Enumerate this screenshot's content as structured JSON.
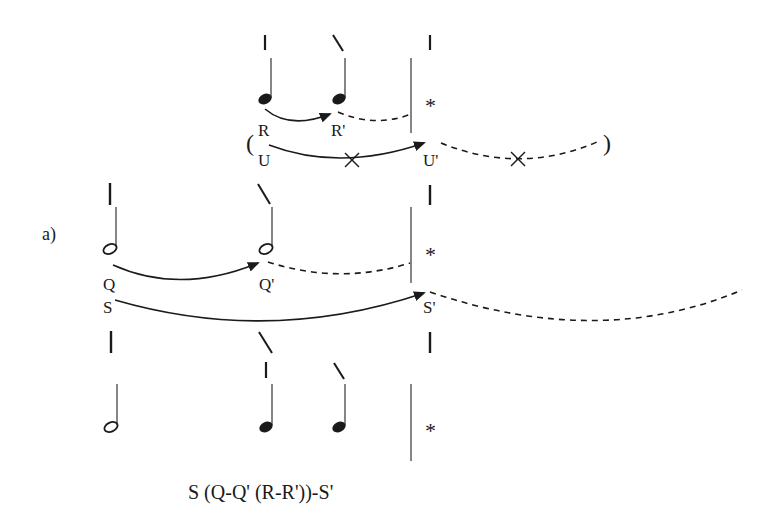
{
  "part_label": "a)",
  "formula": "S (Q-Q' (R-R'))-S'",
  "asterisk": "*",
  "colors": {
    "ink": "#1a1a1a",
    "stem": "#444444"
  },
  "level_top": {
    "labels": {
      "r": "R",
      "r_prime": "R'",
      "u": "U",
      "u_prime": "U'",
      "open_paren": "(",
      "close_paren": ")"
    },
    "notes": [
      "quarter",
      "quarter"
    ],
    "marks": [
      "vertical",
      "slash",
      "vertical"
    ],
    "arcs": [
      {
        "from": "R",
        "to": "R'",
        "style": "solid-arrow"
      },
      {
        "from": "R'",
        "to": "barline",
        "style": "dashed"
      },
      {
        "from": "U",
        "to": "U'",
        "style": "solid-arrow",
        "crossed": true
      },
      {
        "from": "U'",
        "to": ")",
        "style": "dashed",
        "crossed": true
      }
    ]
  },
  "level_middle": {
    "labels": {
      "q": "Q",
      "q_prime": "Q'",
      "s": "S",
      "s_prime": "S'"
    },
    "notes": [
      "half",
      "half"
    ],
    "marks": [
      "vertical",
      "slash",
      "vertical"
    ],
    "arcs": [
      {
        "from": "Q",
        "to": "Q'",
        "style": "solid-arrow"
      },
      {
        "from": "Q'",
        "to": "barline",
        "style": "dashed"
      },
      {
        "from": "S",
        "to": "S'",
        "style": "solid-arrow"
      },
      {
        "from": "S'",
        "to": "continuation",
        "style": "dashed"
      }
    ]
  },
  "level_bottom": {
    "notes": [
      "half",
      "quarter",
      "quarter"
    ],
    "marks": [
      "vertical",
      "slash",
      "vertical",
      "slash",
      "vertical"
    ]
  }
}
